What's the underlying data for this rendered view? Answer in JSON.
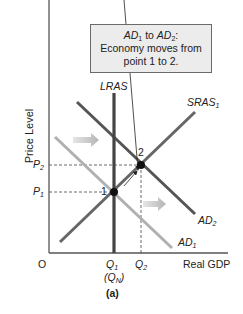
{
  "callout": {
    "line1_a": "AD",
    "line1_a_sub": "1",
    "line1_mid": " to ",
    "line1_b": "AD",
    "line1_b_sub": "2",
    "line1_end": ":",
    "line2": "Economy moves from",
    "line3": "point 1 to 2."
  },
  "axes": {
    "y_label": "Price Level",
    "x_label": "Real GDP",
    "origin": "O"
  },
  "curves": {
    "lras": "LRAS",
    "sras": {
      "base": "SRAS",
      "sub": "1"
    },
    "ad1": {
      "base": "AD",
      "sub": "1"
    },
    "ad2": {
      "base": "AD",
      "sub": "2"
    }
  },
  "ticks": {
    "p2": {
      "base": "P",
      "sub": "2"
    },
    "p1": {
      "base": "P",
      "sub": "1"
    },
    "q1": {
      "base": "Q",
      "sub": "1"
    },
    "qn": {
      "open": "(Q",
      "sub": "N",
      "close": ")"
    },
    "q2": {
      "base": "Q",
      "sub": "2"
    }
  },
  "points": {
    "point1": "1",
    "point2": "2"
  },
  "caption": "(a)",
  "colors": {
    "curve_dark": "#555555",
    "lras": "#444444",
    "ad1": "#b0b0b0",
    "shift_arrow": "#bdbdbd",
    "axis": "#555555",
    "callout_bg": "#ececec"
  }
}
